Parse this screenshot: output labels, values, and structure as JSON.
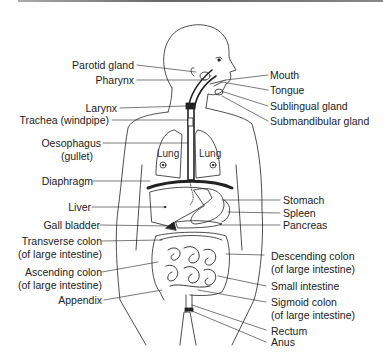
{
  "diagram": {
    "left_labels": [
      {
        "id": "parotid-gland",
        "text": "Parotid gland"
      },
      {
        "id": "pharynx",
        "text": "Pharynx"
      },
      {
        "id": "larynx",
        "text": "Larynx"
      },
      {
        "id": "trachea",
        "text": "Trachea (windpipe)"
      },
      {
        "id": "oesophagus",
        "text": "Oesophagus",
        "text2": "(gullet)"
      },
      {
        "id": "diaphragm",
        "text": "Diaphragm"
      },
      {
        "id": "liver",
        "text": "Liver"
      },
      {
        "id": "gall-bladder",
        "text": "Gall bladder"
      },
      {
        "id": "transverse-colon",
        "text": "Transverse colon",
        "text2": "(of large intestine)"
      },
      {
        "id": "ascending-colon",
        "text": "Ascending colon",
        "text2": "(of large intestine)"
      },
      {
        "id": "appendix",
        "text": "Appendix"
      }
    ],
    "right_labels": [
      {
        "id": "mouth",
        "text": "Mouth"
      },
      {
        "id": "tongue",
        "text": "Tongue"
      },
      {
        "id": "sublingual-gland",
        "text": "Sublingual gland"
      },
      {
        "id": "submandibular-gland",
        "text": "Submandibular gland"
      },
      {
        "id": "stomach",
        "text": "Stomach"
      },
      {
        "id": "spleen",
        "text": "Spleen"
      },
      {
        "id": "pancreas",
        "text": "Pancreas"
      },
      {
        "id": "descending-colon",
        "text": "Descending colon",
        "text2": "(of large intestine)"
      },
      {
        "id": "small-intestine",
        "text": "Small intestine"
      },
      {
        "id": "sigmoid-colon",
        "text": "Sigmoid colon",
        "text2": "(of large intestine)"
      },
      {
        "id": "rectum",
        "text": "Rectum"
      },
      {
        "id": "anus",
        "text": "Anus"
      }
    ],
    "organ_labels": {
      "lung_left": "Lung",
      "lung_right": "Lung"
    }
  }
}
